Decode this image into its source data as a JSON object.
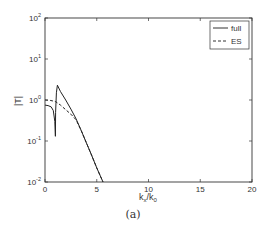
{
  "chart_data": {
    "type": "line",
    "title": "",
    "caption": "(a)",
    "xlabel": "k_x/k_0",
    "ylabel": "|T|",
    "xlim": [
      0,
      20
    ],
    "ylim": [
      0.01,
      100
    ],
    "yscale": "log",
    "grid": false,
    "legend_position": "upper right",
    "x_ticks": [
      "0",
      "5",
      "10",
      "15",
      "20"
    ],
    "y_ticks": [
      "10^-2",
      "10^-1",
      "10^0",
      "10^1",
      "10^2"
    ],
    "series": [
      {
        "name": "full",
        "style": "solid",
        "x": [
          0,
          0.3,
          0.6,
          0.8,
          0.95,
          1.0,
          1.02,
          1.1,
          1.2,
          1.5,
          2.0,
          2.5,
          3.0,
          3.5,
          4.0,
          4.5,
          5.0,
          5.6
        ],
        "values": [
          0.75,
          0.73,
          0.68,
          0.55,
          0.3,
          0.13,
          0.5,
          1.5,
          2.3,
          1.6,
          1.0,
          0.6,
          0.35,
          0.18,
          0.09,
          0.045,
          0.022,
          0.01
        ]
      },
      {
        "name": "ES",
        "style": "dashed",
        "x": [
          0,
          0.5,
          1.0,
          1.5,
          2.0,
          2.5,
          3.0,
          3.5,
          4.0,
          4.5,
          5.0,
          5.6
        ],
        "values": [
          1.0,
          0.98,
          0.92,
          0.75,
          0.58,
          0.45,
          0.33,
          0.18,
          0.09,
          0.045,
          0.022,
          0.01
        ]
      }
    ]
  },
  "labels": {
    "legend_full": "full",
    "legend_es": "ES",
    "caption": "(a)"
  }
}
